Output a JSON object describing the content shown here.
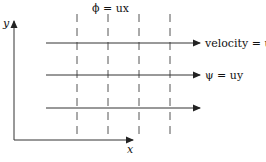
{
  "diagram": {
    "axes": {
      "y_label": "y",
      "x_label": "x"
    },
    "potential_lines": {
      "label": "ϕ = ux",
      "count": 4,
      "style": "dashed",
      "x_positions": [
        77,
        108,
        139,
        170
      ]
    },
    "streamlines": {
      "count": 3,
      "y_positions": [
        43,
        75,
        108
      ],
      "velocity_label": "velocity = u",
      "stream_function_label": "ψ = uy"
    },
    "colors": {
      "line": "#222222",
      "background": "#ffffff"
    }
  }
}
